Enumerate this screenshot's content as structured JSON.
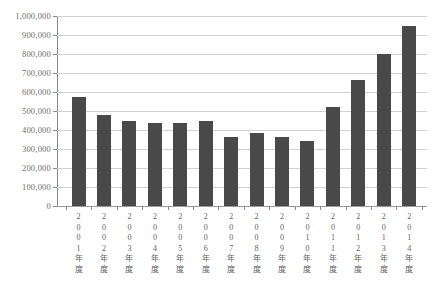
{
  "chart_data": {
    "type": "bar",
    "title": "",
    "subtitle": "",
    "xlabel": "",
    "ylabel": "",
    "ylim": [
      0,
      1000000
    ],
    "ytick_step": 100000,
    "grid": true,
    "legend": false,
    "bar_color": "#494949",
    "gridline_color": "#d2d2d2",
    "axis_color": "#8c8c8c",
    "categories": [
      "2001年度",
      "2002年度",
      "2003年度",
      "2004年度",
      "2005年度",
      "2006年度",
      "2007年度",
      "2008年度",
      "2009年度",
      "2010年度",
      "2011年度",
      "2012年度",
      "2013年度",
      "2014年度"
    ],
    "values": [
      574000,
      480000,
      445000,
      435000,
      435000,
      445000,
      363000,
      385000,
      363000,
      342000,
      521000,
      663000,
      800000,
      947000
    ],
    "ytick_labels": [
      "1,000,000",
      "900,000",
      "800,000",
      "700,000",
      "600,000",
      "500,000",
      "400,000",
      "300,000",
      "200,000",
      "100,000",
      "0"
    ],
    "ytick_values": [
      1000000,
      900000,
      800000,
      700000,
      600000,
      500000,
      400000,
      300000,
      200000,
      100000,
      0
    ]
  }
}
